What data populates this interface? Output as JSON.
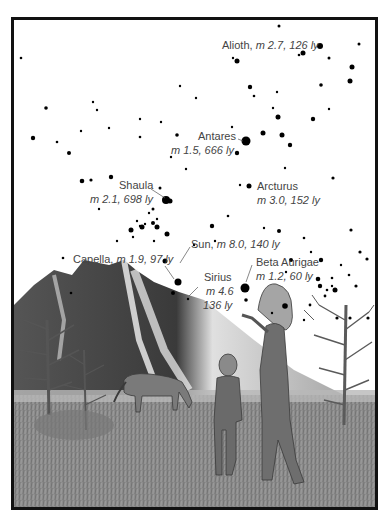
{
  "figure": {
    "stars_labeled": [
      {
        "name": "Alioth",
        "mag": "m 2.7",
        "dist": "126 ly",
        "line1": "Alioth,",
        "line2": "m 2.7, 126 ly"
      },
      {
        "name": "Antares",
        "mag": "m 1.5",
        "dist": "666 ly",
        "line1": "Antares",
        "line2": "m 1.5, 666 ly"
      },
      {
        "name": "Shaula",
        "mag": "m 2.1",
        "dist": "698 ly",
        "line1": "Shaula",
        "line2": "m 2.1, 698 ly"
      },
      {
        "name": "Arcturus",
        "mag": "m 3.0",
        "dist": "152 ly",
        "line1": "Arcturus",
        "line2": "m 3.0, 152 ly"
      },
      {
        "name": "Sun",
        "mag": "m 8.0",
        "dist": "140 ly",
        "line1": "Sun,",
        "line2": "m 8.0, 140 ly"
      },
      {
        "name": "Capella",
        "mag": "m 1.9",
        "dist": "97 ly",
        "line1": "Capella,",
        "line2": "m 1.9, 97 ly"
      },
      {
        "name": "Sirius",
        "mag": "m 4.6",
        "dist": "136 ly",
        "line1": "Sirius",
        "line2": "m 4.6",
        "line3": "136 ly"
      },
      {
        "name": "Beta Aurigae",
        "mag": "m 1.2",
        "dist": "60 ly",
        "line1": "Beta Aurigae",
        "line2": "m 1.2, 60 ly"
      }
    ],
    "colors": {
      "frame": "#111111",
      "star": "#000000",
      "label": "#444444",
      "sky": "#ffffff",
      "ground": "#8a8a8a"
    }
  }
}
